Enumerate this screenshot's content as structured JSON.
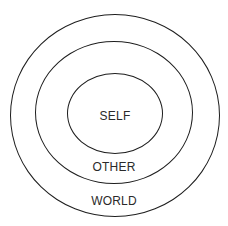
{
  "diagram": {
    "type": "concentric-circles",
    "rings": [
      {
        "id": "inner",
        "label": "SELF"
      },
      {
        "id": "middle",
        "label": "OTHER"
      },
      {
        "id": "outer",
        "label": "WORLD"
      }
    ],
    "colors": {
      "stroke": "#1e1e1e",
      "text": "#2a2a2a",
      "background": "#ffffff"
    }
  }
}
